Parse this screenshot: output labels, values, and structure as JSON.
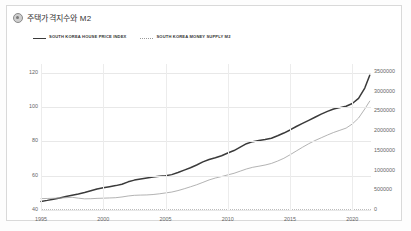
{
  "header": {
    "icon": "gear-icon",
    "title": "주택가격지수와 M2"
  },
  "legend": [
    {
      "key": "house",
      "label": "SOUTH KOREA HOUSE PRICE INDEX",
      "style": "solid",
      "color": "#3a3a3a"
    },
    {
      "key": "m2",
      "label": "SOUTH KOREA MONEY SUPPLY M2",
      "style": "dotted",
      "color": "#9a9a9a"
    }
  ],
  "chart_data": {
    "type": "line",
    "title": "주택가격지수와 M2",
    "xlabel": "",
    "ylabel": "",
    "grid": true,
    "legend_position": "top-left",
    "x_ticks": [
      "1995",
      "2000",
      "2005",
      "2010",
      "2015",
      "2020"
    ],
    "xlim": [
      1995,
      2021.5
    ],
    "left_axis": {
      "name": "SOUTH KOREA HOUSE PRICE INDEX",
      "ticks": [
        40,
        60,
        80,
        100,
        120
      ],
      "ylim": [
        40,
        125
      ]
    },
    "right_axis": {
      "name": "SOUTH KOREA MONEY SUPPLY M2",
      "ticks": [
        0,
        500000,
        1000000,
        1500000,
        2000000,
        2500000,
        3000000,
        3500000
      ],
      "ylim": [
        0,
        3700000
      ]
    },
    "series": [
      {
        "name": "SOUTH KOREA HOUSE PRICE INDEX",
        "axis": "left",
        "color": "#3a3a3a",
        "style": "solid",
        "x": [
          1995,
          1995.5,
          1996,
          1996.5,
          1997,
          1997.5,
          1998,
          1998.5,
          1999,
          1999.5,
          2000,
          2000.5,
          2001,
          2001.5,
          2002,
          2002.5,
          2003,
          2003.5,
          2004,
          2004.5,
          2005,
          2005.5,
          2006,
          2006.5,
          2007,
          2007.5,
          2008,
          2008.5,
          2009,
          2009.5,
          2010,
          2010.5,
          2011,
          2011.5,
          2012,
          2012.5,
          2013,
          2013.5,
          2014,
          2014.5,
          2015,
          2015.5,
          2016,
          2016.5,
          2017,
          2017.5,
          2018,
          2018.5,
          2019,
          2019.5,
          2020,
          2020.5,
          2021,
          2021.4
        ],
        "y": [
          45.0,
          45.6,
          46.3,
          47.0,
          47.8,
          48.6,
          49.3,
          50.2,
          51.2,
          52.2,
          53.0,
          53.6,
          54.2,
          55.0,
          56.4,
          57.4,
          58.0,
          58.6,
          59.2,
          59.6,
          60.0,
          60.6,
          61.8,
          63.2,
          64.6,
          66.2,
          68.0,
          69.4,
          70.4,
          71.6,
          73.2,
          74.6,
          76.6,
          78.6,
          79.8,
          80.4,
          81.0,
          81.8,
          83.2,
          84.8,
          86.6,
          88.6,
          90.4,
          92.2,
          94.0,
          95.8,
          97.4,
          98.8,
          99.6,
          100.4,
          102.0,
          105.0,
          111.0,
          118.5
        ]
      },
      {
        "name": "SOUTH KOREA MONEY SUPPLY M2",
        "axis": "right",
        "color": "#a0a0a0",
        "style": "solid-thin",
        "x": [
          1995,
          1995.5,
          1996,
          1996.5,
          1997,
          1997.5,
          1998,
          1998.5,
          1999,
          1999.5,
          2000,
          2000.5,
          2001,
          2001.5,
          2002,
          2002.5,
          2003,
          2003.5,
          2004,
          2004.5,
          2005,
          2005.5,
          2006,
          2006.5,
          2007,
          2007.5,
          2008,
          2008.5,
          2009,
          2009.5,
          2010,
          2010.5,
          2011,
          2011.5,
          2012,
          2012.5,
          2013,
          2013.5,
          2014,
          2014.5,
          2015,
          2015.5,
          2016,
          2016.5,
          2017,
          2017.5,
          2018,
          2018.5,
          2019,
          2019.5,
          2020,
          2020.5,
          2021,
          2021.4
        ],
        "y": [
          290000,
          292000,
          297000,
          303000,
          312000,
          322000,
          300000,
          283000,
          286000,
          295000,
          300000,
          305000,
          312000,
          330000,
          355000,
          372000,
          378000,
          382000,
          392000,
          410000,
          432000,
          455000,
          492000,
          538000,
          588000,
          640000,
          700000,
          762000,
          810000,
          848000,
          890000,
          930000,
          985000,
          1040000,
          1082000,
          1110000,
          1140000,
          1180000,
          1240000,
          1310000,
          1400000,
          1495000,
          1590000,
          1680000,
          1760000,
          1830000,
          1900000,
          1965000,
          2020000,
          2075000,
          2180000,
          2330000,
          2560000,
          2760000
        ]
      }
    ]
  }
}
